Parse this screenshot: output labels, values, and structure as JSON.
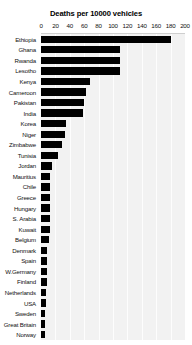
{
  "chart_data": {
    "type": "bar",
    "orientation": "horizontal",
    "title": "Deaths per 10000 vehicles",
    "xlabel": "",
    "ylabel": "",
    "xlim": [
      0,
      200
    ],
    "xticks": [
      0,
      20,
      40,
      60,
      80,
      100,
      120,
      140,
      160,
      180,
      200
    ],
    "grid": true,
    "legend": "none",
    "bar_color": "#000000",
    "panel_color": "#f2f2f2",
    "categories": [
      "Ethiopia",
      "Ghana",
      "Rwanda",
      "Lesotho",
      "Kenya",
      "Cameroon",
      "Pakistan",
      "India",
      "Korea",
      "Niger",
      "Zimbabwe",
      "Tunisia",
      "Jordan",
      "Mauritius",
      "Chile",
      "Greece",
      "Hungary",
      "S. Arabia",
      "Kuwait",
      "Belgium",
      "Denmark",
      "Spain",
      "W.Germany",
      "Finland",
      "Netherlands",
      "USA",
      "Sweden",
      "Great Britain",
      "Norway"
    ],
    "values": [
      180,
      110,
      110,
      110,
      68,
      62,
      60,
      58,
      35,
      34,
      29,
      24,
      15,
      13,
      12,
      12,
      12,
      12,
      12,
      11,
      9,
      9,
      9,
      8,
      7,
      7,
      6,
      6,
      6
    ]
  }
}
